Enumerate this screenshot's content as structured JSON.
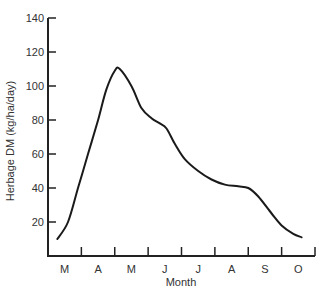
{
  "chart_data": {
    "type": "line",
    "title": "",
    "xlabel": "Month",
    "ylabel": "Herbage DM (kg/ha/day)",
    "ylim": [
      0,
      140
    ],
    "yticks": [
      20,
      40,
      60,
      80,
      100,
      120,
      140
    ],
    "categories": [
      "M",
      "A",
      "M",
      "J",
      "J",
      "A",
      "S",
      "O"
    ],
    "grid": false,
    "legend": null,
    "series": [
      {
        "name": "Herbage DM growth",
        "x": [
          0.28,
          0.6,
          0.9,
          1.2,
          1.5,
          1.75,
          2.0,
          2.15,
          2.5,
          2.8,
          3.1,
          3.35,
          3.55,
          3.8,
          4.1,
          4.5,
          4.9,
          5.3,
          5.7,
          6.0,
          6.3,
          6.7,
          7.0,
          7.35,
          7.6
        ],
        "y": [
          10,
          20,
          40,
          60,
          80,
          98,
          109,
          110,
          100,
          87,
          81,
          78,
          75,
          66,
          57,
          50,
          45,
          42,
          41,
          40,
          35,
          25,
          18,
          13,
          11
        ]
      }
    ]
  }
}
